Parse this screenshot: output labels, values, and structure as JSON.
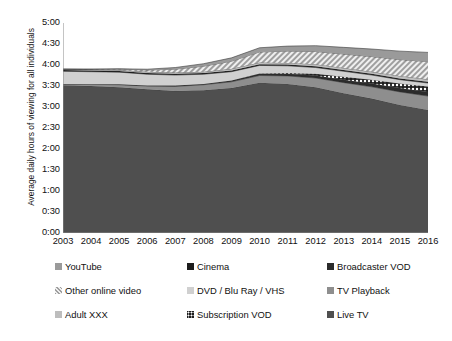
{
  "chart_data": {
    "type": "area",
    "stacked": true,
    "title": "",
    "subtitle": "",
    "xlabel": "",
    "ylabel": "Average daily hours of viewing for all individuals",
    "grid": false,
    "legend_position": "bottom",
    "x": [
      2003,
      2004,
      2005,
      2006,
      2007,
      2008,
      2009,
      2010,
      2011,
      2012,
      2013,
      2014,
      2015,
      2016
    ],
    "categories": [
      "2003",
      "2004",
      "2005",
      "2006",
      "2007",
      "2008",
      "2009",
      "2010",
      "2011",
      "2012",
      "2013",
      "2014",
      "2015",
      "2016"
    ],
    "ylim": [
      0,
      5
    ],
    "ytick_labels": [
      "0:00",
      "0:30",
      "1:00",
      "1:30",
      "2:00",
      "2:30",
      "3:00",
      "3:30",
      "4:00",
      "4:30",
      "5:00"
    ],
    "ytick_values": [
      0,
      0.5,
      1,
      1.5,
      2,
      2.5,
      3,
      3.5,
      4,
      4.5,
      5
    ],
    "y_format": "h:mm",
    "stack_order_bottom_to_top": [
      "Live TV",
      "TV Playback",
      "Broadcaster VOD",
      "Subscription VOD",
      "DVD / Blu Ray / VHS",
      "Cinema",
      "Adult XXX",
      "Other online video",
      "YouTube"
    ],
    "series": [
      {
        "name": "Live TV",
        "fill": "#4f4f4f",
        "pattern": "solid",
        "values": [
          3.52,
          3.5,
          3.47,
          3.42,
          3.38,
          3.4,
          3.45,
          3.58,
          3.55,
          3.47,
          3.33,
          3.2,
          3.05,
          2.93
        ]
      },
      {
        "name": "TV Playback",
        "fill": "#8e8e8e",
        "pattern": "solid",
        "values": [
          0.03,
          0.04,
          0.06,
          0.08,
          0.11,
          0.13,
          0.15,
          0.17,
          0.19,
          0.22,
          0.25,
          0.28,
          0.31,
          0.33
        ]
      },
      {
        "name": "Broadcaster VOD",
        "fill": "#2b2b2b",
        "pattern": "solid",
        "values": [
          0.0,
          0.0,
          0.01,
          0.01,
          0.02,
          0.02,
          0.03,
          0.04,
          0.05,
          0.06,
          0.07,
          0.08,
          0.09,
          0.1
        ]
      },
      {
        "name": "Subscription VOD",
        "fill": "#f2f2f2",
        "pattern": "dots",
        "values": [
          0.0,
          0.0,
          0.0,
          0.0,
          0.0,
          0.0,
          0.0,
          0.01,
          0.02,
          0.04,
          0.07,
          0.09,
          0.11,
          0.13
        ]
      },
      {
        "name": "DVD / Blu Ray / VHS",
        "fill": "#d0d0d0",
        "pattern": "solid",
        "values": [
          0.3,
          0.3,
          0.29,
          0.27,
          0.25,
          0.23,
          0.21,
          0.19,
          0.17,
          0.15,
          0.13,
          0.11,
          0.09,
          0.08
        ]
      },
      {
        "name": "Cinema",
        "fill": "#1c1c1c",
        "pattern": "solid",
        "values": [
          0.03,
          0.03,
          0.03,
          0.03,
          0.03,
          0.03,
          0.03,
          0.03,
          0.03,
          0.03,
          0.03,
          0.03,
          0.03,
          0.03
        ]
      },
      {
        "name": "Adult XXX",
        "fill": "#bdbdbd",
        "pattern": "solid",
        "values": [
          0.02,
          0.02,
          0.02,
          0.03,
          0.03,
          0.03,
          0.04,
          0.04,
          0.04,
          0.05,
          0.05,
          0.05,
          0.06,
          0.06
        ]
      },
      {
        "name": "Other online video",
        "fill": "#e6e6e6",
        "pattern": "hatch",
        "values": [
          0.0,
          0.01,
          0.02,
          0.04,
          0.08,
          0.13,
          0.18,
          0.25,
          0.28,
          0.3,
          0.33,
          0.36,
          0.39,
          0.42
        ]
      },
      {
        "name": "YouTube",
        "fill": "#9a9a9a",
        "pattern": "solid",
        "values": [
          0.0,
          0.0,
          0.01,
          0.02,
          0.04,
          0.06,
          0.08,
          0.1,
          0.12,
          0.14,
          0.16,
          0.18,
          0.2,
          0.22
        ]
      }
    ],
    "totals": [
      3.9,
      3.9,
      3.91,
      3.9,
      3.94,
      4.03,
      4.17,
      4.41,
      4.45,
      4.46,
      4.42,
      4.38,
      4.33,
      4.3
    ]
  },
  "legend": {
    "rows": [
      [
        {
          "label": "YouTube",
          "swatch": "#9a9a9a",
          "pattern": "solid"
        },
        {
          "label": "Cinema",
          "swatch": "#1c1c1c",
          "pattern": "solid"
        },
        {
          "label": "Broadcaster VOD",
          "swatch": "#2b2b2b",
          "pattern": "solid"
        }
      ],
      [
        {
          "label": "Other online video",
          "swatch": "#e6e6e6",
          "pattern": "hatch"
        },
        {
          "label": "DVD / Blu Ray / VHS",
          "swatch": "#d0d0d0",
          "pattern": "solid"
        },
        {
          "label": "TV Playback",
          "swatch": "#8e8e8e",
          "pattern": "solid"
        }
      ],
      [
        {
          "label": "Adult XXX",
          "swatch": "#bdbdbd",
          "pattern": "solid"
        },
        {
          "label": "Subscription VOD",
          "swatch": "#f2f2f2",
          "pattern": "dots"
        },
        {
          "label": "Live TV",
          "swatch": "#4f4f4f",
          "pattern": "solid"
        }
      ]
    ]
  }
}
